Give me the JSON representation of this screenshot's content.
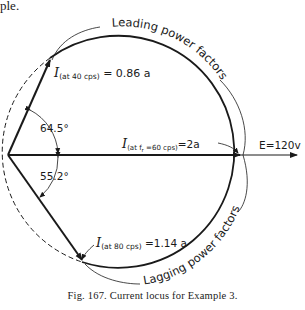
{
  "header": {
    "fragment": "ple."
  },
  "diagram": {
    "type": "phasor current locus",
    "labels": {
      "leading": "Leading power factors",
      "lagging": "Lagging power factors",
      "i40_main": "I",
      "i40_sub": "(at 40 cps)",
      "i40_val": " = 0.86 a",
      "i60_main": "I",
      "i60_sub": "(at f",
      "i60_subr": "r",
      "i60_sub2": " =60 cps)",
      "i60_val": "=2a",
      "i80_main": "I",
      "i80_sub": "(at 80 cps)",
      "i80_val": " =1.14 a",
      "voltage": "E=120v",
      "angle_upper": "64.5°",
      "angle_lower": "55.2°"
    },
    "colors": {
      "ink": "#1a1a1a",
      "background": "#ffffff"
    }
  },
  "caption": {
    "text": "Fig. 167. Current locus for Example 3."
  }
}
